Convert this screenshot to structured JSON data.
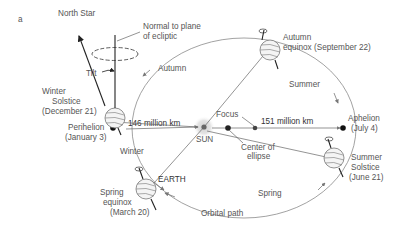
{
  "panel_label": "a",
  "north_star": "North Star",
  "normal": {
    "line1": "Normal to plane",
    "line2": "of ecliptic"
  },
  "tilt": "Tilt",
  "seasons": {
    "autumn": "Autumn",
    "summer": "Summer",
    "winter": "Winter",
    "spring": "Spring"
  },
  "positions": {
    "winter_solstice": {
      "line1": "Winter",
      "line2": "Solstice",
      "line3": "(December 21)"
    },
    "autumn_equinox": {
      "line1": "Autumn",
      "line2": "equinox (September 22)"
    },
    "summer_solstice": {
      "line1": "Summer",
      "line2": "Solstice",
      "line3": "(June 21)"
    },
    "spring_equinox": {
      "line1": "Spring",
      "line2": "equinox",
      "line3": "(March 20)"
    },
    "perihelion": {
      "line1": "Perihelion",
      "line2": "(January 3)"
    },
    "aphelion": {
      "line1": "Aphelion",
      "line2": "(July 4)"
    }
  },
  "distances": {
    "perihelion": "146 million km",
    "aphelion": "151 million km"
  },
  "sun": "SUN",
  "earth": "EARTH",
  "focus": "Focus",
  "center": {
    "line1": "Center of",
    "line2": "ellipse"
  },
  "orbital_path": "Orbital path",
  "colors": {
    "orbit": "#8a8a8a",
    "text": "#555555",
    "sun_glow": "#d8d8d8"
  }
}
